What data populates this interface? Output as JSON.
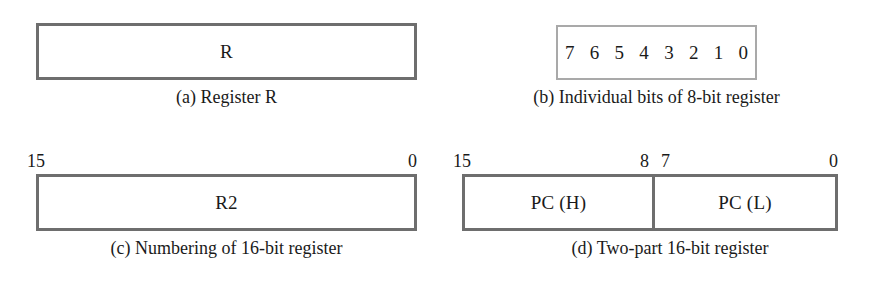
{
  "figure": {
    "panels": [
      {
        "id": "a",
        "box_label": "R",
        "caption": "(a) Register R",
        "bit_numbers": []
      },
      {
        "id": "b",
        "caption": "(b) Individual bits of 8-bit register",
        "bits": [
          "7",
          "6",
          "5",
          "4",
          "3",
          "2",
          "1",
          "0"
        ]
      },
      {
        "id": "c",
        "box_label": "R2",
        "caption": "(c) Numbering of 16-bit register",
        "bit_numbers": [
          "15",
          "0"
        ]
      },
      {
        "id": "d",
        "caption": "(d) Two-part 16-bit register",
        "left_label": "PC (H)",
        "right_label": "PC (L)",
        "bit_numbers": [
          "15",
          "8",
          "7",
          "0"
        ]
      }
    ]
  },
  "colors": {
    "background": "#ffffff",
    "border_strong": "#6e6e6e",
    "border_light": "#a9a9a9",
    "text": "#1a1a1a"
  }
}
